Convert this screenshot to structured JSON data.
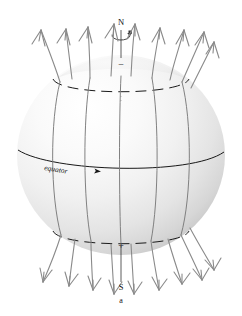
{
  "figure": {
    "caption": "a",
    "background_color": "#ffffff",
    "sphere": {
      "name": "planet-sphere",
      "fill_light": "#fdfdfd",
      "fill_mid": "#f0f0f0",
      "fill_dark": "#c9c9c9",
      "center_x": 121,
      "center_y": 155,
      "radius_x": 104,
      "radius_y": 100
    },
    "labels": {
      "north_pole": "N",
      "south_pole": "S",
      "equator": "equator",
      "north_sign": "−",
      "south_sign": "+",
      "caption": "a"
    },
    "line_color": "#1a1a1a",
    "field_line_color": "#6e6e6e",
    "field_line_count_visible": 5,
    "rotation_indicator": "spin-arrow",
    "dashed_circles": 2,
    "arrow_heads": {
      "top_count": 9,
      "bottom_count": 9,
      "style": "open-v-barbed"
    }
  }
}
